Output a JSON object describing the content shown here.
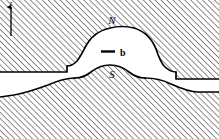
{
  "figure": {
    "type": "cross-section-diagram",
    "title": "",
    "background_color": "#ffffff",
    "line_color": "#000000",
    "hatch_color": "#4a4a4a",
    "hatch_angle_deg": 45,
    "hatch_spacing_px": 4.2,
    "width": 219,
    "height": 139
  },
  "axis": {
    "name": "vertical-axis",
    "label": "z",
    "direction": "up",
    "arrow_x": 11,
    "arrow_tip_y": 6,
    "arrow_base_y": 36
  },
  "labels": {
    "north_pole": "N",
    "south_pole": "S",
    "field_vector": "b"
  },
  "regions": [
    {
      "name": "upper-hatched-medium",
      "fill": "hatched",
      "description": "Hatched region filling the upper part of the frame, interrupted by the central dome"
    },
    {
      "name": "lower-hatched-medium",
      "fill": "hatched",
      "description": "Hatched region filling the lower part of the frame below the sloping interface"
    },
    {
      "name": "inner-dome-hatched",
      "fill": "hatched",
      "description": "Hatched lobe bounded above by the S interface inside the dome"
    },
    {
      "name": "white-lens",
      "fill": "white",
      "description": "Clear lens-shaped gap between the N arc above and the S arc below, containing the b vector label"
    },
    {
      "name": "white-channel-left",
      "fill": "white",
      "description": "Clear horizontal channel running left from the dome between the two hatched media"
    },
    {
      "name": "white-channel-right",
      "fill": "white",
      "description": "Clear horizontal channel running right from the dome between the two hatched media"
    }
  ],
  "curves": [
    {
      "name": "n-arc",
      "label": "N",
      "description": "Upper arc of the dome, apex near x=110 y=29"
    },
    {
      "name": "s-arc",
      "label": "S",
      "description": "Lower arc inside the dome, apex near x=110 y=64"
    },
    {
      "name": "upper-interface-left",
      "description": "Near-horizontal interface from left edge to the dome shoulder"
    },
    {
      "name": "upper-interface-right",
      "description": "Near-horizontal interface from the dome shoulder to the right edge"
    },
    {
      "name": "lower-interface",
      "description": "Sloping interface rising from lower-left to the dome then descending to lower-right"
    }
  ],
  "marker": {
    "name": "b-vector-bar",
    "description": "Short bold horizontal bar preceding the b label",
    "x1": 101,
    "x2": 115,
    "y": 52
  }
}
